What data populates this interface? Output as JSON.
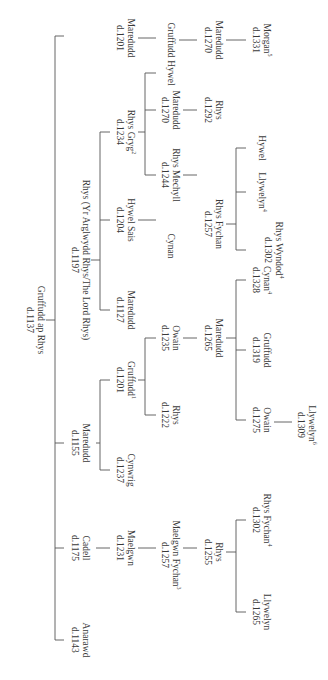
{
  "diagram": {
    "nodes": [
      {
        "id": "gruffudd_ap_rhys",
        "name": "Gruffudd ap Rhys",
        "date": "d.1137",
        "sup": "",
        "x": 320,
        "y": 293
      },
      {
        "id": "anarawd",
        "name": "Anarawd",
        "date": "d.1143",
        "sup": "",
        "x": 640,
        "y": 248
      },
      {
        "id": "cadell",
        "name": "Cadell",
        "date": "d.1175",
        "sup": "",
        "x": 548,
        "y": 248
      },
      {
        "id": "maredudd_1155",
        "name": "Maredudd",
        "date": "d.1155",
        "sup": "",
        "x": 443,
        "y": 248
      },
      {
        "id": "rhys_lord",
        "name": "Rhys (Yr Arglwydd Rhys/The Lord Rhys)",
        "date": "d.1197",
        "sup": "",
        "x": 260,
        "y": 248
      },
      {
        "id": "maelgwn_1231",
        "name": "Maelgwn",
        "date": "d.1231",
        "sup": "",
        "x": 548,
        "y": 203
      },
      {
        "id": "cynwrig",
        "name": "Cynwrig",
        "date": "d.1237",
        "sup": "",
        "x": 470,
        "y": 203
      },
      {
        "id": "gruffudd_1201",
        "name": "Gruffudd",
        "date": "d.1201",
        "sup": "1",
        "x": 380,
        "y": 203
      },
      {
        "id": "maredudd_1127",
        "name": "Maredudd",
        "date": "d.1127",
        "sup": "",
        "x": 310,
        "y": 203
      },
      {
        "id": "hywel_sais",
        "name": "Hywel Sais",
        "date": "d.1204",
        "sup": "",
        "x": 220,
        "y": 203
      },
      {
        "id": "rhys_gryg",
        "name": "Rhys Gryg",
        "date": "d.1234",
        "sup": "2",
        "x": 132,
        "y": 203
      },
      {
        "id": "maredudd_1201",
        "name": "Maredudd",
        "date": "d.1201",
        "sup": "",
        "x": 38,
        "y": 203
      },
      {
        "id": "maelgwn_fychan",
        "name": "Maelgwn Fychan",
        "date": "d.1257",
        "sup": "3",
        "x": 555,
        "y": 158
      },
      {
        "id": "rhys_1222",
        "name": "Rhys",
        "date": "d.1222",
        "sup": "",
        "x": 415,
        "y": 158
      },
      {
        "id": "owain_1235",
        "name": "Owain",
        "date": "d.1235",
        "sup": "",
        "x": 338,
        "y": 158
      },
      {
        "id": "cynan",
        "name": "Cynan",
        "date": "",
        "sup": "",
        "x": 246,
        "y": 158
      },
      {
        "id": "rhys_mechyll",
        "name": "Rhys Mechyll",
        "date": "d.1244",
        "sup": "",
        "x": 175,
        "y": 158
      },
      {
        "id": "maredudd_1270a",
        "name": "Maredudd",
        "date": "d.1270",
        "sup": "",
        "x": 110,
        "y": 158
      },
      {
        "id": "hywel_a",
        "name": "Hywel",
        "date": "",
        "sup": "",
        "x": 73,
        "y": 158
      },
      {
        "id": "gruffudd_b",
        "name": "Gruffudd",
        "date": "",
        "sup": "",
        "x": 40,
        "y": 158
      },
      {
        "id": "rhys_1255",
        "name": "Rhys",
        "date": "d.1255",
        "sup": "",
        "x": 552,
        "y": 115
      },
      {
        "id": "maredudd_1265",
        "name": "Maredudd",
        "date": "d.1265",
        "sup": "",
        "x": 338,
        "y": 115
      },
      {
        "id": "rhys_fychan",
        "name": "Rhys Fychan",
        "date": "d.1257",
        "sup": "",
        "x": 224,
        "y": 115
      },
      {
        "id": "rhys_1292",
        "name": "Rhys",
        "date": "d.1292",
        "sup": "",
        "x": 110,
        "y": 115
      },
      {
        "id": "maredudd_1270b",
        "name": "Maredudd",
        "date": "d.1270",
        "sup": "",
        "x": 40,
        "y": 115
      },
      {
        "id": "llywelyn_1265",
        "name": "Llywelyn",
        "date": "d.1265",
        "sup": "",
        "x": 612,
        "y": 67
      },
      {
        "id": "rhys_fychan_1302",
        "name": "Rhys Fychan",
        "date": "d.1302",
        "sup": "4",
        "x": 520,
        "y": 67
      },
      {
        "id": "owain_1275",
        "name": "Owain",
        "date": "d.1275",
        "sup": "",
        "x": 420,
        "y": 67
      },
      {
        "id": "gruffudd_1319",
        "name": "Gruffudd",
        "date": "d.1319",
        "sup": "",
        "x": 350,
        "y": 67
      },
      {
        "id": "cynan_1328",
        "name": "Cynan",
        "date": "d.1328",
        "sup": "4",
        "x": 280,
        "y": 67
      },
      {
        "id": "rhys_wyndod",
        "name": "Rhys Wyndod",
        "date": "d.1302",
        "sup": "4",
        "x": 250,
        "y": 55
      },
      {
        "id": "llywelyn_4",
        "name": "Llywelyn",
        "date": "",
        "sup": "4",
        "x": 192,
        "y": 67
      },
      {
        "id": "hywel_b",
        "name": "Hywel",
        "date": "",
        "sup": "",
        "x": 148,
        "y": 67
      },
      {
        "id": "morgan",
        "name": "Morgan",
        "date": "d.1331",
        "sup": "5",
        "x": 40,
        "y": 67
      },
      {
        "id": "llywelyn_1309",
        "name": "Llywelyn",
        "date": "d.1309",
        "sup": "6",
        "x": 425,
        "y": 22
      }
    ]
  }
}
